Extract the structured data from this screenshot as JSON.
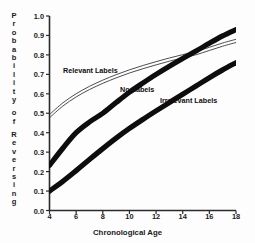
{
  "chart_data": {
    "type": "line",
    "title": "",
    "xlabel": "Chronological Age",
    "ylabel": "Probability of Reversing",
    "xlim": [
      4,
      18
    ],
    "ylim": [
      0.0,
      1.0
    ],
    "grid": false,
    "legend_position": "inline-annotations",
    "xticks": [
      "4",
      "6",
      "8",
      "10",
      "12",
      "14",
      "16",
      "18"
    ],
    "xtick_values": [
      4,
      6,
      8,
      10,
      12,
      14,
      16,
      18
    ],
    "yticks": [
      "0.0",
      "0.1",
      "0.2",
      "0.3",
      "0.4",
      "0.5",
      "0.6",
      "0.7",
      "0.8",
      "0.9",
      "1.0"
    ],
    "ytick_values": [
      0.0,
      0.1,
      0.2,
      0.3,
      0.4,
      0.5,
      0.6,
      0.7,
      0.8,
      0.9,
      1.0
    ],
    "x": [
      4,
      5,
      6,
      7,
      8,
      9,
      10,
      11,
      12,
      13,
      14,
      15,
      16,
      17,
      18
    ],
    "series": [
      {
        "name": "Relevant Labels",
        "style": "thin-outline-band",
        "color": "#1a1a1a",
        "values": [
          0.485,
          0.545,
          0.592,
          0.63,
          0.662,
          0.69,
          0.715,
          0.737,
          0.757,
          0.776,
          0.793,
          0.809,
          0.831,
          0.853,
          0.872
        ]
      },
      {
        "name": "No Labels",
        "style": "thick-solid",
        "color": "#0d0d0d",
        "values": [
          0.232,
          0.32,
          0.4,
          0.455,
          0.5,
          0.555,
          0.608,
          0.655,
          0.7,
          0.742,
          0.782,
          0.82,
          0.86,
          0.898,
          0.93
        ]
      },
      {
        "name": "Irrelevant Labels",
        "style": "thick-solid",
        "color": "#0d0d0d",
        "values": [
          0.1,
          0.15,
          0.205,
          0.262,
          0.318,
          0.372,
          0.422,
          0.468,
          0.512,
          0.555,
          0.598,
          0.64,
          0.683,
          0.723,
          0.76
        ]
      }
    ],
    "annotations": [
      {
        "text": "Relevant Labels",
        "x": 6.3,
        "y": 0.735
      },
      {
        "text": "No Labels",
        "x": 10.2,
        "y": 0.64
      },
      {
        "text": "Irrelevant Labels",
        "x": 12.8,
        "y": 0.585
      }
    ]
  },
  "axis": {
    "y_title_letters": [
      "P",
      "r",
      "o",
      "b",
      "a",
      "b",
      "i",
      "l",
      "i",
      "t",
      "y",
      "",
      "o",
      "f",
      "",
      "R",
      "e",
      "v",
      "e",
      "r",
      "s",
      "i",
      "n",
      "g"
    ]
  },
  "colors": {
    "background": "#fdfdfd",
    "axis": "#2b2b2b",
    "ink": "#0d0d0d",
    "thin_line": "#3a3a3a"
  }
}
